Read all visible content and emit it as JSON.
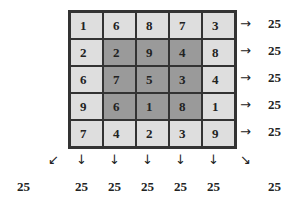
{
  "grid": [
    [
      1,
      6,
      8,
      7,
      3
    ],
    [
      2,
      2,
      9,
      4,
      8
    ],
    [
      6,
      7,
      5,
      3,
      4
    ],
    [
      9,
      6,
      1,
      8,
      1
    ],
    [
      7,
      4,
      2,
      3,
      9
    ]
  ],
  "shading": [
    [
      "light",
      "light",
      "light",
      "light",
      "light"
    ],
    [
      "light",
      "dark",
      "dark",
      "dark",
      "light"
    ],
    [
      "light",
      "dark",
      "dark",
      "dark",
      "light"
    ],
    [
      "light",
      "dark",
      "dark",
      "dark",
      "light"
    ],
    [
      "light",
      "light",
      "light",
      "light",
      "light"
    ]
  ],
  "row_sums": [
    "25",
    "25",
    "25",
    "25",
    "25"
  ],
  "col_sums": [
    "25",
    "25",
    "25",
    "25",
    "25"
  ],
  "diag_sums": {
    "anti": "25",
    "main": "25"
  },
  "arrows": {
    "right": "→",
    "down": "↓",
    "down_left": "↙",
    "down_right": "↘"
  },
  "colors": {
    "light": "#dedede",
    "dark": "#9a9a9a",
    "border": "#333333"
  }
}
